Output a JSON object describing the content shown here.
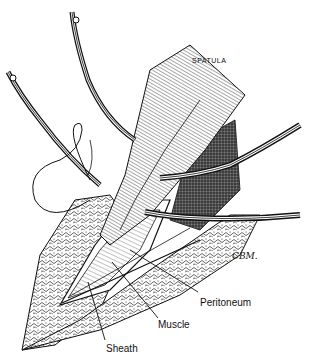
{
  "figure": {
    "type": "surgical-illustration",
    "style": "black-and-white pen-and-ink",
    "labels": {
      "spatula": "SPATULA",
      "peritoneum": "Peritoneum",
      "muscle": "Muscle",
      "sheath": "Sheath"
    },
    "signature": "CBM.",
    "instruments": [
      "retractor-upper-left",
      "retractor-upper-middle",
      "retractor-right-upper",
      "retractor-right-lower",
      "spatula",
      "suture-loop"
    ],
    "colors": {
      "ink": "#111111",
      "paper": "#ffffff"
    }
  }
}
